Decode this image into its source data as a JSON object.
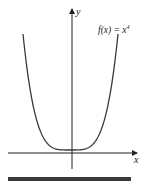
{
  "chart_data": {
    "type": "line",
    "title": "",
    "function_label": "f(x) = x^4",
    "function_label_display": {
      "base": "f(x) = x",
      "exponent": "4"
    },
    "xlabel": "x",
    "ylabel": "y",
    "x": [
      -1.5,
      -1.25,
      -1.0,
      -0.75,
      -0.5,
      -0.25,
      0,
      0.25,
      0.5,
      0.75,
      1.0,
      1.25,
      1.5
    ],
    "series": [
      {
        "name": "f(x) = x^4",
        "values": [
          5.0625,
          2.4414,
          1.0,
          0.3164,
          0.0625,
          0.0039,
          0,
          0.0039,
          0.0625,
          0.3164,
          1.0,
          2.4414,
          5.0625
        ]
      }
    ],
    "grid": false,
    "legend": "none",
    "axis_ticks": "none",
    "colors": {
      "curve": "#3a3a3a",
      "axes": "#222222",
      "bar": "#3a3a3a"
    }
  },
  "labels": {
    "x_axis": "x",
    "y_axis": "y",
    "func_base": "f(x) = x",
    "func_exp": "4"
  }
}
